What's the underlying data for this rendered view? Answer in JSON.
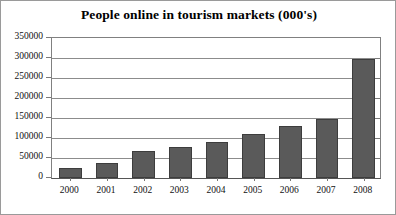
{
  "chart_data": {
    "type": "bar",
    "title": "People online in tourism markets (000's)",
    "xlabel": "",
    "ylabel": "",
    "categories": [
      "2000",
      "2001",
      "2002",
      "2003",
      "2004",
      "2005",
      "2006",
      "2007",
      "2008"
    ],
    "values": [
      25000,
      38000,
      67000,
      78000,
      90000,
      110000,
      130000,
      148000,
      298000
    ],
    "ylim": [
      0,
      350000
    ],
    "ytick_labels": [
      "350000",
      "300000",
      "250000",
      "200000",
      "150000",
      "100000",
      "50000",
      "0"
    ],
    "ytick_values": [
      350000,
      300000,
      250000,
      200000,
      150000,
      100000,
      50000,
      0
    ],
    "grid": true,
    "legend": false,
    "series": [
      {
        "name": "People online",
        "values": [
          25000,
          38000,
          67000,
          78000,
          90000,
          110000,
          130000,
          148000,
          298000
        ]
      }
    ],
    "colors": {
      "bar_fill": "#5a5a5a",
      "bar_border": "#3d3d3d",
      "gridline": "#8c8c8c",
      "axis": "#555555",
      "text": "#111111",
      "background": "#ffffff",
      "frame_border": "#9a9a9a"
    }
  }
}
